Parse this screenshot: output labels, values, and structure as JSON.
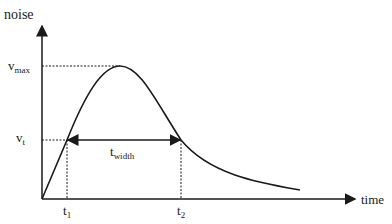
{
  "diagram": {
    "y_axis_label": "noise",
    "x_axis_label": "time",
    "v_max_main": "v",
    "v_max_sub": "max",
    "v_t_main": "v",
    "v_t_sub": "t",
    "t_width_main": "t",
    "t_width_sub": "width",
    "t1_main": "t",
    "t1_sub": "1",
    "t2_main": "t",
    "t2_sub": "2",
    "colors": {
      "line": "#1a1a1a",
      "background": "#ffffff"
    }
  }
}
